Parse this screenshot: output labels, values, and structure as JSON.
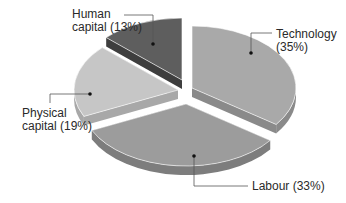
{
  "chart_data": {
    "type": "pie",
    "title": "",
    "style": "3d-exploded",
    "categories": [
      "Technology",
      "Labour",
      "Physical capital",
      "Human capital"
    ],
    "values": [
      35,
      33,
      19,
      13
    ],
    "unit": "%",
    "colors": [
      "#a9a9a9",
      "#9c9c9c",
      "#c6c6c6",
      "#5e5e5e"
    ],
    "side_colors": [
      "#8a8a8a",
      "#7d7d7d",
      "#a8a8a8",
      "#3e3e3e"
    ],
    "legend": "none (direct labels with leader lines)",
    "labels": [
      {
        "line1": "Technology",
        "line2": "(35%)"
      },
      {
        "line1": "Labour (33%)",
        "line2": ""
      },
      {
        "line1": "Physical",
        "line2": "capital (19%)"
      },
      {
        "line1": "Human",
        "line2": "capital (13%)"
      }
    ]
  }
}
